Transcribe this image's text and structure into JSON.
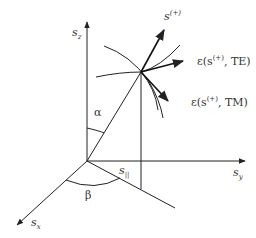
{
  "diagram": {
    "axes": {
      "z": {
        "symbol": "s",
        "sub": "z"
      },
      "y": {
        "symbol": "s",
        "sub": "y"
      },
      "x": {
        "symbol": "s",
        "sub": "x"
      }
    },
    "vector_label": {
      "symbol": "s",
      "sup": "(+)"
    },
    "te_label": {
      "prefix": "ε(s",
      "sup": "(+)",
      "suffix": ", TE)"
    },
    "tm_label": {
      "prefix": "ε(s",
      "sup": "(+)",
      "suffix": ", TM)"
    },
    "angles": {
      "alpha": "α",
      "beta": "β"
    },
    "projection_label": {
      "symbol": "s",
      "sub": "||"
    },
    "colors": {
      "line": "#222222",
      "text": "#333333"
    }
  }
}
